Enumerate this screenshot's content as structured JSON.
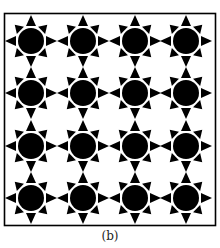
{
  "figure": {
    "caption": "(b)",
    "frame": {
      "x": 4.5,
      "y": 13.5,
      "width": 211,
      "height": 212,
      "stroke": "#000000"
    },
    "pattern": {
      "rows": 4,
      "cols": 4,
      "col_centers": [
        31,
        83,
        135,
        186
      ],
      "row_centers": [
        41,
        93,
        146,
        198
      ],
      "sun": {
        "circle_radius": 13,
        "ray_count": 8,
        "cardinal_ray_inner": 15,
        "cardinal_ray_outer": 26,
        "cardinal_ray_halfwidth": 5,
        "diagonal_ray_inner": 15,
        "diagonal_ray_outer": 23,
        "diagonal_ray_halfwidth": 5,
        "fill": "#000000"
      }
    }
  }
}
